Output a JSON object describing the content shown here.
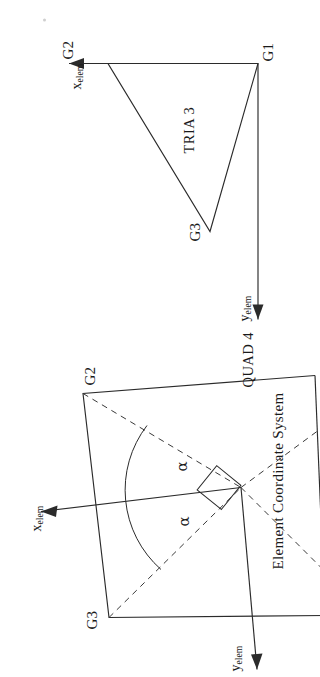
{
  "page": {
    "caption": "Element Coordinate System",
    "background_color": "#ffffff",
    "ink_color": "#2b2b2b"
  },
  "figures": [
    {
      "id": "tria3",
      "title": "TRIA 3",
      "nodes": [
        {
          "id": "G1",
          "label": "G1"
        },
        {
          "id": "G2",
          "label": "G2"
        },
        {
          "id": "G3",
          "label": "G3"
        }
      ],
      "axes": [
        {
          "id": "x",
          "symbol": "x",
          "subscript": "elem"
        },
        {
          "id": "y",
          "symbol": "y",
          "subscript": "elem"
        }
      ]
    },
    {
      "id": "quad4",
      "title": "QUAD 4",
      "nodes": [
        {
          "id": "G2",
          "label": "G2"
        },
        {
          "id": "G3",
          "label": "G3"
        }
      ],
      "axes": [
        {
          "id": "x",
          "symbol": "x",
          "subscript": "elem"
        },
        {
          "id": "y",
          "symbol": "y",
          "subscript": "elem"
        }
      ],
      "angles": [
        {
          "id": "alpha-upper",
          "label": "α"
        },
        {
          "id": "alpha-lower",
          "label": "α"
        }
      ],
      "markers": [
        {
          "id": "right-angle",
          "label": ""
        }
      ]
    }
  ]
}
